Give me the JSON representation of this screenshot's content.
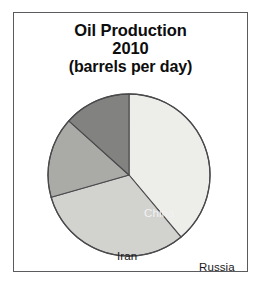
{
  "figure": {
    "frame_color": "#5a5a5f",
    "background": "#ffffff"
  },
  "title": {
    "line1": "Oil Production",
    "line2": "2010",
    "line3": "(barrels per day)"
  },
  "chart_data": {
    "type": "pie",
    "title": "Oil Production 2010 (barrels per day)",
    "subtitle": "(barrels per day)",
    "xlabel": "",
    "ylabel": "",
    "legend_position": "none",
    "grid": false,
    "labels_inside_slices": true,
    "start_angle_deg": 0,
    "direction": "clockwise",
    "categories": [
      "Russia",
      "Saudi Arabia",
      "Iran",
      "China"
    ],
    "values": [
      38.9,
      31.7,
      16.1,
      13.3
    ],
    "value_unit": "percent of chart total",
    "slices": [
      {
        "name": "Russia",
        "percent": 38.9,
        "start_deg": 0,
        "end_deg": 140,
        "sweep_deg": 140,
        "color": "#ededea",
        "label": "Russia",
        "label_color": "#1a1a1a"
      },
      {
        "name": "Saudi Arabia",
        "percent": 31.7,
        "start_deg": 140,
        "end_deg": 254,
        "sweep_deg": 114,
        "color": "#d2d2cf",
        "label": "Saudi Arabia",
        "label_color": "#1a1a1a"
      },
      {
        "name": "Iran",
        "percent": 16.1,
        "start_deg": 254,
        "end_deg": 312,
        "sweep_deg": 58,
        "color": "#aaaaa7",
        "label": "Iran",
        "label_color": "#1a1a1a"
      },
      {
        "name": "China",
        "percent": 13.3,
        "start_deg": 312,
        "end_deg": 360,
        "sweep_deg": 48,
        "color": "#828280",
        "label": "China",
        "label_color": "#f2f2f2"
      }
    ],
    "geometry": {
      "center_x": 82,
      "center_y": 82,
      "radius": 81,
      "outline_color": "#4a4a4d"
    }
  }
}
